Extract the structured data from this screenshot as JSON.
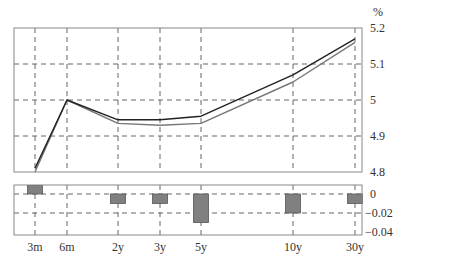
{
  "chart_data": [
    {
      "type": "line",
      "title": "",
      "xlabel": "",
      "ylabel": "%",
      "categories": [
        "3m",
        "6m",
        "2y",
        "3y",
        "5y",
        "10y",
        "30y"
      ],
      "ylim": [
        4.8,
        5.2
      ],
      "yticks": [
        "5.2",
        "5.1",
        "5",
        "4.9",
        "4.8"
      ],
      "grid": true,
      "legend": null,
      "series": [
        {
          "name": "curve-a",
          "color": "#222222",
          "values": [
            4.81,
            5.0,
            4.945,
            4.945,
            4.955,
            5.07,
            5.17
          ]
        },
        {
          "name": "curve-b",
          "color": "#777777",
          "values": [
            4.8,
            5.0,
            4.935,
            4.93,
            4.935,
            5.05,
            5.16
          ]
        }
      ]
    },
    {
      "type": "bar",
      "title": "",
      "xlabel": "",
      "ylabel": "",
      "categories": [
        "3m",
        "6m",
        "2y",
        "3y",
        "5y",
        "10y",
        "30y"
      ],
      "ylim": [
        -0.04,
        0.01
      ],
      "yticks": [
        "0",
        "−0.02",
        "−0.04"
      ],
      "grid": true,
      "series": [
        {
          "name": "difference",
          "color": "#808080",
          "values": [
            0.01,
            0.0,
            -0.01,
            -0.01,
            -0.03,
            -0.02,
            -0.01
          ]
        }
      ]
    }
  ],
  "labels": {
    "unit": "%",
    "x_ticks": [
      "3m",
      "6m",
      "2y",
      "3y",
      "5y",
      "10y",
      "30y"
    ],
    "main_y_ticks": [
      "5.2",
      "5.1",
      "5",
      "4.9",
      "4.8"
    ],
    "diff_y_ticks": [
      "0",
      "−0.02",
      "−0.04"
    ]
  }
}
